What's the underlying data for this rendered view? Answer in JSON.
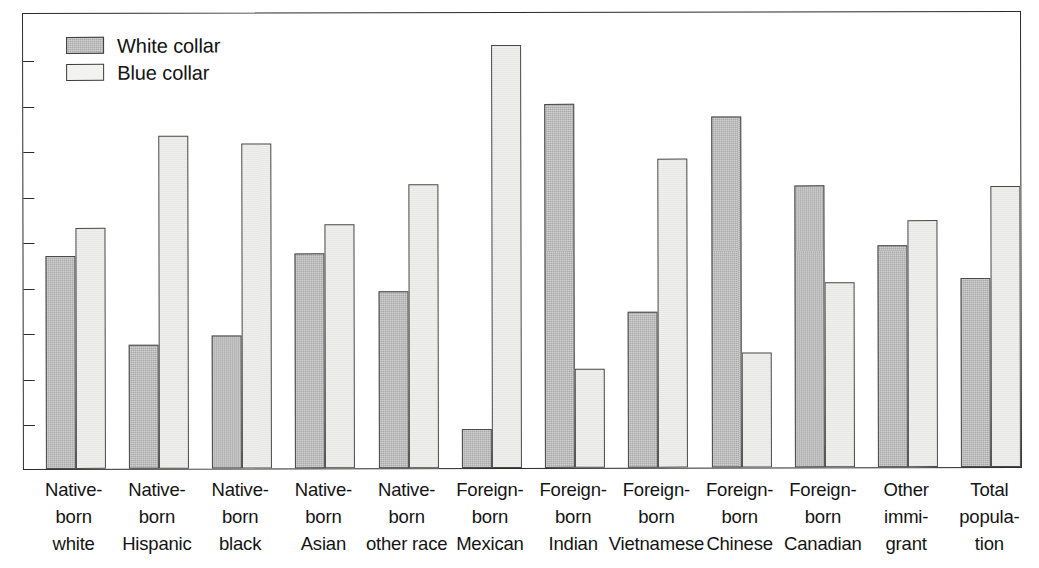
{
  "chart_data": {
    "type": "bar",
    "title": "",
    "subtitle": "",
    "xlabel": "",
    "ylabel": "",
    "ylim": [
      0,
      100
    ],
    "yticks": [
      10,
      20,
      30,
      40,
      50,
      60,
      70,
      80,
      90
    ],
    "grid": false,
    "legend_position": "top-left",
    "categories": [
      "Native-\nborn\nwhite",
      "Native-\nborn\nHispanic",
      "Native-\nborn\nblack",
      "Native-\nborn\nAsian",
      "Native-\nborn\nother race",
      "Foreign-\nborn\nMexican",
      "Foreign-\nborn\nIndian",
      "Foreign-\nborn\nVietnamese",
      "Foreign-\nborn\nChinese",
      "Foreign-\nborn\nCanadian",
      "Other\nimmi-\ngrant",
      "Total\npopula-\ntion"
    ],
    "series": [
      {
        "name": "White collar",
        "color": "#a9a9a9",
        "values": [
          46.8,
          27.2,
          29.3,
          47.2,
          38.8,
          8.6,
          79.9,
          34.2,
          77.0,
          62.0,
          48.7,
          41.6
        ]
      },
      {
        "name": "Blue collar",
        "color": "#efefee",
        "values": [
          53.0,
          73.1,
          71.3,
          53.6,
          62.3,
          92.8,
          21.8,
          67.8,
          25.3,
          40.7,
          54.3,
          61.7
        ]
      }
    ]
  },
  "legend": {
    "items": [
      {
        "label": "White collar"
      },
      {
        "label": "Blue collar"
      }
    ]
  },
  "axis": {
    "y_tick_labels": [
      "90",
      "80",
      "70",
      "60",
      "50",
      "40",
      "30",
      "20",
      "10"
    ]
  }
}
